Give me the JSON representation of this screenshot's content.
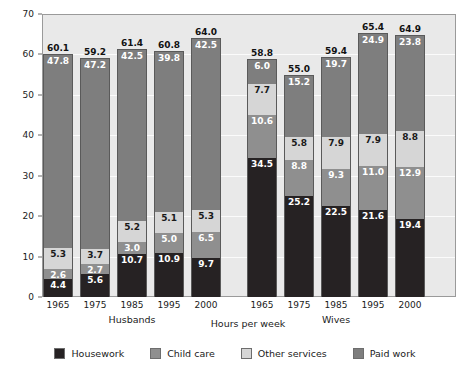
{
  "chart_data": {
    "type": "bar",
    "subtype": "stacked",
    "title": "",
    "xlabel": "Hours per week",
    "ylabel": "Hours per week",
    "ylim": [
      0,
      70
    ],
    "ytick_step": 10,
    "yticks": [
      "0",
      "10",
      "20",
      "30",
      "40",
      "50",
      "60",
      "70"
    ],
    "grid": true,
    "legend_position": "bottom",
    "groups": [
      "Husbands",
      "Wives"
    ],
    "categories": [
      "1965",
      "1975",
      "1985",
      "1995",
      "2000"
    ],
    "series": [
      {
        "name": "Housework",
        "color": "#262223",
        "label_color": "#ffffff",
        "values_husbands": [
          4.4,
          5.6,
          10.7,
          10.9,
          9.7
        ],
        "values_wives": [
          34.5,
          25.2,
          22.5,
          21.6,
          19.4
        ]
      },
      {
        "name": "Child care",
        "color": "#8f8f8f",
        "label_color": "#ffffff",
        "values_husbands": [
          2.6,
          2.7,
          3.0,
          5.0,
          6.5
        ],
        "values_wives": [
          10.6,
          8.8,
          9.3,
          11.0,
          12.9
        ]
      },
      {
        "name": "Other services",
        "color": "#d6d6d6",
        "label_color": "#1a1a1a",
        "values_husbands": [
          5.3,
          3.7,
          5.2,
          5.1,
          5.3
        ],
        "values_wives": [
          7.7,
          5.8,
          7.9,
          7.9,
          8.8
        ]
      },
      {
        "name": "Paid work",
        "color": "#7e7e7e",
        "label_color": "#ffffff",
        "values_husbands": [
          47.8,
          47.2,
          42.5,
          39.8,
          42.5
        ],
        "values_wives": [
          6.0,
          15.2,
          19.7,
          24.9,
          23.8
        ]
      }
    ],
    "totals_husbands": [
      60.1,
      59.2,
      61.4,
      60.8,
      64.0
    ],
    "totals_wives": [
      58.8,
      55.0,
      59.4,
      65.4,
      64.9
    ],
    "bars": [
      {
        "group": "Husbands",
        "category": "1965",
        "total": "60.1",
        "segments": [
          {
            "name": "Housework",
            "value": "4.4"
          },
          {
            "name": "Child care",
            "value": "2.6"
          },
          {
            "name": "Other services",
            "value": "5.3"
          },
          {
            "name": "Paid work",
            "value": "47.8"
          }
        ]
      },
      {
        "group": "Husbands",
        "category": "1975",
        "total": "59.2",
        "segments": [
          {
            "name": "Housework",
            "value": "5.6"
          },
          {
            "name": "Child care",
            "value": "2.7"
          },
          {
            "name": "Other services",
            "value": "3.7"
          },
          {
            "name": "Paid work",
            "value": "47.2"
          }
        ]
      },
      {
        "group": "Husbands",
        "category": "1985",
        "total": "61.4",
        "segments": [
          {
            "name": "Housework",
            "value": "10.7"
          },
          {
            "name": "Child care",
            "value": "3.0"
          },
          {
            "name": "Other services",
            "value": "5.2"
          },
          {
            "name": "Paid work",
            "value": "42.5"
          }
        ]
      },
      {
        "group": "Husbands",
        "category": "1995",
        "total": "60.8",
        "segments": [
          {
            "name": "Housework",
            "value": "10.9"
          },
          {
            "name": "Child care",
            "value": "5.0"
          },
          {
            "name": "Other services",
            "value": "5.1"
          },
          {
            "name": "Paid work",
            "value": "39.8"
          }
        ]
      },
      {
        "group": "Husbands",
        "category": "2000",
        "total": "64.0",
        "segments": [
          {
            "name": "Housework",
            "value": "9.7"
          },
          {
            "name": "Child care",
            "value": "6.5"
          },
          {
            "name": "Other services",
            "value": "5.3"
          },
          {
            "name": "Paid work",
            "value": "42.5"
          }
        ]
      },
      {
        "group": "Wives",
        "category": "1965",
        "total": "58.8",
        "segments": [
          {
            "name": "Housework",
            "value": "34.5"
          },
          {
            "name": "Child care",
            "value": "10.6"
          },
          {
            "name": "Other services",
            "value": "7.7"
          },
          {
            "name": "Paid work",
            "value": "6.0"
          }
        ]
      },
      {
        "group": "Wives",
        "category": "1975",
        "total": "55.0",
        "segments": [
          {
            "name": "Housework",
            "value": "25.2"
          },
          {
            "name": "Child care",
            "value": "8.8"
          },
          {
            "name": "Other services",
            "value": "5.8"
          },
          {
            "name": "Paid work",
            "value": "15.2"
          }
        ]
      },
      {
        "group": "Wives",
        "category": "1985",
        "total": "59.4",
        "segments": [
          {
            "name": "Housework",
            "value": "22.5"
          },
          {
            "name": "Child care",
            "value": "9.3"
          },
          {
            "name": "Other services",
            "value": "7.9"
          },
          {
            "name": "Paid work",
            "value": "19.7"
          }
        ]
      },
      {
        "group": "Wives",
        "category": "1995",
        "total": "65.4",
        "segments": [
          {
            "name": "Housework",
            "value": "21.6"
          },
          {
            "name": "Child care",
            "value": "11.0"
          },
          {
            "name": "Other services",
            "value": "7.9"
          },
          {
            "name": "Paid work",
            "value": "24.9"
          }
        ]
      },
      {
        "group": "Wives",
        "category": "2000",
        "total": "64.9",
        "segments": [
          {
            "name": "Housework",
            "value": "19.4"
          },
          {
            "name": "Child care",
            "value": "12.9"
          },
          {
            "name": "Other services",
            "value": "8.8"
          },
          {
            "name": "Paid work",
            "value": "23.8"
          }
        ]
      }
    ]
  },
  "legend": {
    "items": [
      {
        "label": "Housework",
        "color": "#262223"
      },
      {
        "label": "Child care",
        "color": "#8f8f8f"
      },
      {
        "label": "Other services",
        "color": "#d6d6d6"
      },
      {
        "label": "Paid work",
        "color": "#7e7e7e"
      }
    ]
  },
  "axes": {
    "y_title": "Hours per week",
    "x_title": "Hours per week",
    "group_labels": [
      "Husbands",
      "Wives"
    ]
  }
}
